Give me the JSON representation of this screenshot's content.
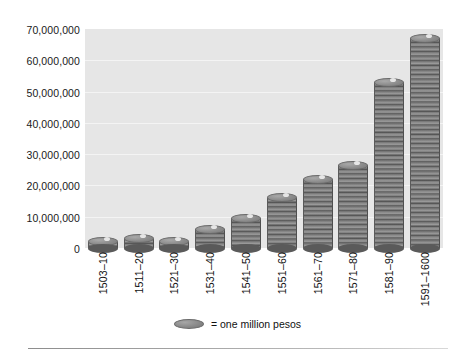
{
  "chart_data": {
    "type": "bar",
    "title": "",
    "subtitle": "",
    "xlabel": "",
    "ylabel": "",
    "categories": [
      "1503–10",
      "1511–20",
      "1521–30",
      "1531–40",
      "1541–50",
      "1551–60",
      "1561–70",
      "1571–80",
      "1581–90",
      "1591–1600"
    ],
    "values": [
      2000000,
      3000000,
      2000000,
      6000000,
      9500000,
      16000000,
      22000000,
      26500000,
      53000000,
      67000000
    ],
    "ylim": [
      0,
      70000000
    ],
    "ytick_labels": [
      "70,000,000",
      "60,000,000",
      "50,000,000",
      "40,000,000",
      "30,000,000",
      "20,000,000",
      "10,000,000",
      "0"
    ],
    "ytick_values": [
      70000000,
      60000000,
      50000000,
      40000000,
      30000000,
      20000000,
      10000000,
      0
    ],
    "grid": true,
    "legend_position": "bottom-center",
    "legend": [
      {
        "marker": "coin-icon",
        "label": "= one million pesos"
      }
    ],
    "annotations": [],
    "colors": {
      "plot_background": "#e6e6e6",
      "gridline": "#f4f4f4",
      "coin_fill": "#8a8a8a",
      "coin_shadow": "#5a5a5a",
      "text": "#111111",
      "page_background": "#ffffff",
      "rule": "#8d8d8d"
    }
  },
  "legend": {
    "marker_name": "coin-icon",
    "text": "= one million pesos"
  }
}
